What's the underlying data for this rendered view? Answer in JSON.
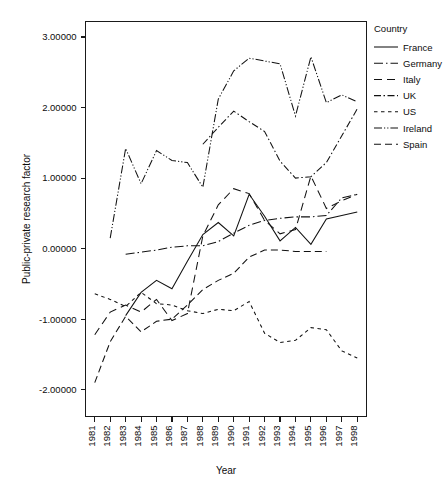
{
  "chart_data": {
    "type": "line",
    "title": "",
    "xlabel": "Year",
    "ylabel": "Public-private research factor",
    "legend_title": "Country",
    "legend_position": "right",
    "grid": false,
    "x": [
      1981,
      1982,
      1983,
      1984,
      1985,
      1986,
      1987,
      1988,
      1989,
      1990,
      1991,
      1992,
      1993,
      1994,
      1995,
      1996,
      1997,
      1998
    ],
    "categories": [
      "1981",
      "1982",
      "1983",
      "1984",
      "1985",
      "1986",
      "1987",
      "1988",
      "1989",
      "1990",
      "1991",
      "1992",
      "1993",
      "1994",
      "1995",
      "1996",
      "1997",
      "1998"
    ],
    "xlim": [
      1980.4,
      1998.6
    ],
    "ylim": [
      -2.38,
      3.22
    ],
    "yticks": [
      -2.0,
      -1.0,
      0.0,
      1.0,
      2.0,
      3.0
    ],
    "ytick_labels": [
      "-2.00000",
      "-1.00000",
      "0.00000",
      "1.00000",
      "2.00000",
      "3.00000"
    ],
    "series": [
      {
        "name": "France",
        "dash_style": "solid",
        "dasharray": "none",
        "x_start": 1983,
        "values": [
          null,
          null,
          -0.95,
          -0.62,
          -0.45,
          -0.57,
          -0.18,
          0.2,
          0.37,
          0.18,
          0.77,
          0.46,
          0.11,
          0.3,
          0.06,
          0.42,
          0.47,
          0.52
        ]
      },
      {
        "name": "Germany",
        "dash_style": "long-dash-dot",
        "dasharray": "9,3,1.5,3",
        "x_start": 1983,
        "values": [
          null,
          null,
          -0.08,
          -0.05,
          -0.02,
          0.02,
          0.04,
          0.04,
          0.1,
          0.22,
          0.33,
          0.4,
          0.43,
          0.45,
          0.45,
          0.47,
          0.72,
          0.77
        ]
      },
      {
        "name": "Italy",
        "dash_style": "long-dash",
        "dasharray": "8,5",
        "x_start": 1981,
        "values": [
          -1.22,
          -0.9,
          -0.8,
          -0.9,
          -0.72,
          -1.02,
          -0.92,
          0.18,
          0.62,
          0.85,
          0.78,
          0.4,
          0.21,
          0.27,
          1.03,
          0.57,
          0.68,
          0.77
        ]
      },
      {
        "name": "UK",
        "dash_style": "dash-dot",
        "dasharray": "7,2.5,1.5,2.5",
        "x_start": 1988,
        "values": [
          null,
          null,
          null,
          null,
          null,
          null,
          null,
          1.48,
          1.72,
          1.95,
          1.8,
          1.66,
          1.24,
          1.0,
          1.02,
          1.22,
          1.6,
          1.98
        ]
      },
      {
        "name": "US",
        "dash_style": "short-dash",
        "dasharray": "3.5,3.5",
        "x_start": 1981,
        "values": [
          -0.64,
          -0.72,
          -0.82,
          -0.62,
          -0.78,
          -0.8,
          -0.88,
          -0.92,
          -0.86,
          -0.88,
          -0.75,
          -1.2,
          -1.33,
          -1.3,
          -1.12,
          -1.15,
          -1.45,
          -1.55
        ]
      },
      {
        "name": "Ireland",
        "dash_style": "dash-dot-dot",
        "dasharray": "8,2,1.2,2,1.2,2",
        "x_start": 1982,
        "values": [
          null,
          0.15,
          1.42,
          0.92,
          1.39,
          1.25,
          1.22,
          0.87,
          2.12,
          2.52,
          2.7,
          2.66,
          2.62,
          1.88,
          2.72,
          2.07,
          2.18,
          2.08
        ]
      },
      {
        "name": "Spain",
        "dash_style": "long-dash-gap",
        "dasharray": "7,4",
        "x_start": 1981,
        "values": [
          -1.9,
          -1.32,
          -0.96,
          -1.18,
          -1.03,
          -1.0,
          -0.8,
          -0.58,
          -0.45,
          -0.35,
          -0.12,
          -0.02,
          -0.02,
          -0.04,
          -0.04,
          -0.04,
          null,
          null
        ]
      }
    ]
  },
  "legend": {
    "title": "Country",
    "entries": [
      {
        "label": "France"
      },
      {
        "label": "Germany"
      },
      {
        "label": "Italy"
      },
      {
        "label": "UK"
      },
      {
        "label": "US"
      },
      {
        "label": "Ireland"
      },
      {
        "label": "Spain"
      }
    ]
  },
  "axes": {
    "x_title": "Year",
    "y_title": "Public-private research factor"
  }
}
